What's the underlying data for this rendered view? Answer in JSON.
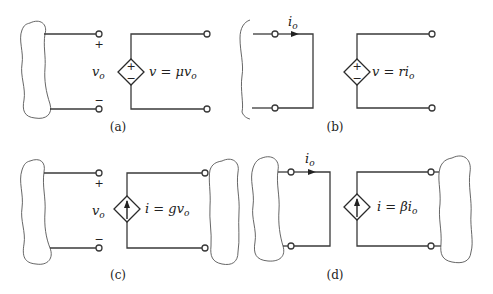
{
  "figure": {
    "panels": [
      {
        "id": "a",
        "caption": "(a)",
        "type": "voltage-controlled voltage source",
        "control_variable": "v",
        "control_subscript": "o",
        "plus_sign": "+",
        "minus_sign": "−",
        "source_equation_lhs": "v = μv",
        "source_equation_sub": "o",
        "source_symbol_top": "+",
        "source_symbol_bottom": "−"
      },
      {
        "id": "b",
        "caption": "(b)",
        "type": "current-controlled voltage source",
        "control_variable": "i",
        "control_subscript": "o",
        "source_equation_lhs": "v = ri",
        "source_equation_sub": "o",
        "source_symbol_top": "+",
        "source_symbol_bottom": "−"
      },
      {
        "id": "c",
        "caption": "(c)",
        "type": "voltage-controlled current source",
        "control_variable": "v",
        "control_subscript": "o",
        "plus_sign": "+",
        "minus_sign": "−",
        "source_equation_lhs": "i = gv",
        "source_equation_sub": "o"
      },
      {
        "id": "d",
        "caption": "(d)",
        "type": "current-controlled current source",
        "control_variable": "i",
        "control_subscript": "o",
        "source_equation_lhs": "i = βi",
        "source_equation_sub": "o"
      }
    ]
  }
}
